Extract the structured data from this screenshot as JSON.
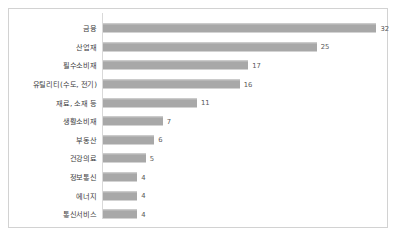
{
  "chart_data": {
    "type": "bar",
    "orientation": "horizontal",
    "title": "",
    "subtitle": "",
    "xlabel": "",
    "ylabel": "",
    "grid": false,
    "legend": false,
    "axis_range": [
      0,
      33
    ],
    "data_labels": true,
    "categories": [
      "금융",
      "산업재",
      "필수소비재",
      "유틸리티(수도, 전기)",
      "재료, 소재 등",
      "생활소비재",
      "부동산",
      "건강의료",
      "정보통신",
      "에너지",
      "통신서비스"
    ],
    "values": [
      32,
      25,
      17,
      16,
      11,
      7,
      6,
      5,
      4,
      4,
      4
    ],
    "colors": {
      "bar": "#a8a8a8",
      "bar_edge": "#c4c4c4",
      "axis": "#d9d9d9",
      "frame": "#d2d2d2",
      "label_text": "#3b3b3b",
      "value_text": "#585858",
      "background": "#ffffff"
    }
  }
}
